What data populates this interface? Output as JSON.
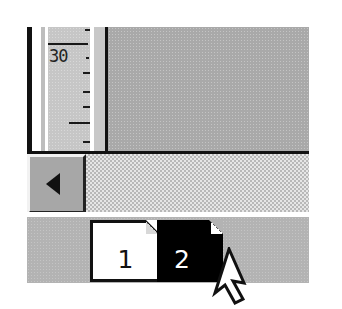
{
  "ruler": {
    "label": "30",
    "orientation": "vertical"
  },
  "scrollbar": {
    "left_arrow_icon": "left-triangle-icon"
  },
  "page_tabs": {
    "tabs": [
      {
        "label": "1",
        "selected": false
      },
      {
        "label": "2",
        "selected": true
      }
    ]
  },
  "cursor": {
    "icon": "arrow-pointer-icon"
  },
  "colors": {
    "content_gray": "#a9a9a9",
    "ruler_gray": "#c6c6c6",
    "border_black": "#111111",
    "selected_tab": "#000000",
    "unselected_tab": "#ffffff"
  }
}
